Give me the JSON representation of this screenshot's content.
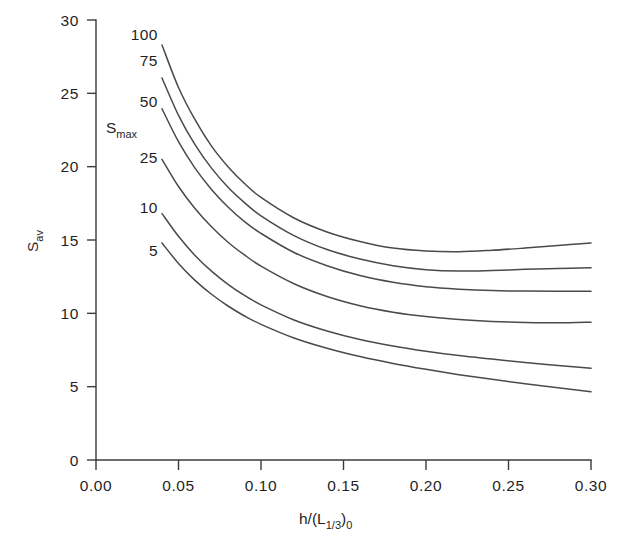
{
  "figure": {
    "background_color": "#ffffff",
    "line_color": "#4a4a4a",
    "axis_color": "#3b3b3b",
    "text_color": "#1f1f1f"
  },
  "axes": {
    "x_title_main": "h/(L",
    "x_title_sub1": "1/3",
    "x_title_mid": ")",
    "x_title_sub2": "0",
    "y_title_main": "S",
    "y_title_sub": "av",
    "legend_title_main": "S",
    "legend_title_sub": "max",
    "x_ticks": [
      "0.00",
      "0.05",
      "0.10",
      "0.15",
      "0.20",
      "0.25",
      "0.30"
    ],
    "y_ticks": [
      "0",
      "5",
      "10",
      "15",
      "20",
      "25",
      "30"
    ]
  },
  "chart_data": {
    "type": "line",
    "title": "",
    "xlabel": "h/(L_1/3)_0",
    "ylabel": "S_av",
    "xlim": [
      0.0,
      0.3
    ],
    "ylim": [
      0,
      30
    ],
    "xticks": [
      0.0,
      0.05,
      0.1,
      0.15,
      0.2,
      0.25,
      0.3
    ],
    "yticks": [
      0,
      5,
      10,
      15,
      20,
      25,
      30
    ],
    "grid": false,
    "legend_position": "inside-upper-left (curve end labels)",
    "legend_title": "S_max",
    "series": [
      {
        "name": "100",
        "label": "100",
        "x": [
          0.04,
          0.05,
          0.06,
          0.07,
          0.08,
          0.09,
          0.1,
          0.12,
          0.14,
          0.16,
          0.18,
          0.2,
          0.22,
          0.24,
          0.26,
          0.28,
          0.3
        ],
        "y": [
          28.3,
          25.4,
          23.2,
          21.4,
          20.0,
          18.85,
          17.9,
          16.5,
          15.55,
          14.9,
          14.45,
          14.25,
          14.2,
          14.3,
          14.45,
          14.62,
          14.8
        ]
      },
      {
        "name": "75",
        "label": "75",
        "x": [
          0.04,
          0.05,
          0.06,
          0.07,
          0.08,
          0.09,
          0.1,
          0.12,
          0.14,
          0.16,
          0.18,
          0.2,
          0.22,
          0.24,
          0.26,
          0.28,
          0.3
        ],
        "y": [
          26.05,
          23.5,
          21.5,
          19.9,
          18.6,
          17.55,
          16.65,
          15.3,
          14.35,
          13.7,
          13.25,
          12.98,
          12.88,
          12.92,
          13.0,
          13.05,
          13.1
        ]
      },
      {
        "name": "50",
        "label": "50",
        "x": [
          0.04,
          0.05,
          0.06,
          0.07,
          0.08,
          0.09,
          0.1,
          0.12,
          0.14,
          0.16,
          0.18,
          0.2,
          0.22,
          0.24,
          0.26,
          0.28,
          0.3
        ],
        "y": [
          23.95,
          21.7,
          19.9,
          18.45,
          17.25,
          16.25,
          15.45,
          14.15,
          13.25,
          12.58,
          12.12,
          11.82,
          11.65,
          11.55,
          11.52,
          11.5,
          11.5
        ]
      },
      {
        "name": "25",
        "label": "25",
        "x": [
          0.04,
          0.05,
          0.06,
          0.07,
          0.08,
          0.09,
          0.1,
          0.12,
          0.14,
          0.16,
          0.18,
          0.2,
          0.22,
          0.24,
          0.26,
          0.28,
          0.3
        ],
        "y": [
          20.5,
          18.65,
          17.15,
          15.9,
          14.85,
          13.98,
          13.22,
          12.02,
          11.15,
          10.52,
          10.08,
          9.78,
          9.58,
          9.45,
          9.38,
          9.35,
          9.4
        ]
      },
      {
        "name": "10",
        "label": "10",
        "x": [
          0.04,
          0.05,
          0.06,
          0.07,
          0.08,
          0.09,
          0.1,
          0.12,
          0.14,
          0.16,
          0.18,
          0.2,
          0.22,
          0.24,
          0.26,
          0.28,
          0.3
        ],
        "y": [
          16.8,
          15.25,
          13.95,
          12.88,
          11.98,
          11.22,
          10.58,
          9.55,
          8.8,
          8.22,
          7.78,
          7.42,
          7.12,
          6.88,
          6.65,
          6.45,
          6.25
        ]
      },
      {
        "name": "5",
        "label": "5",
        "x": [
          0.04,
          0.05,
          0.06,
          0.07,
          0.08,
          0.09,
          0.1,
          0.12,
          0.14,
          0.16,
          0.18,
          0.2,
          0.22,
          0.24,
          0.26,
          0.28,
          0.3
        ],
        "y": [
          14.8,
          13.4,
          12.25,
          11.3,
          10.5,
          9.82,
          9.25,
          8.32,
          7.62,
          7.05,
          6.58,
          6.18,
          5.82,
          5.5,
          5.2,
          4.92,
          4.65
        ]
      }
    ]
  }
}
